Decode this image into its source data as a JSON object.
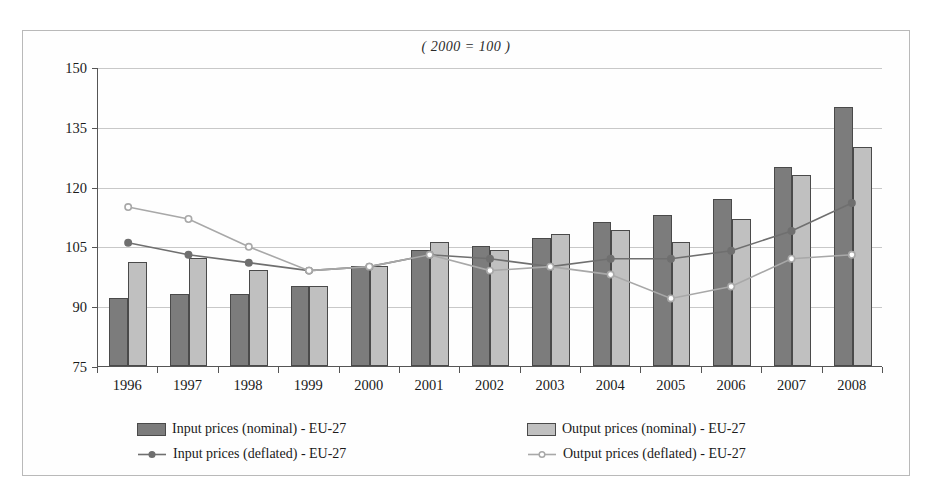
{
  "chart_data": {
    "type": "bar",
    "title": "( 2000 = 100 )",
    "subtitle": "",
    "xlabel": "",
    "ylabel": "",
    "ylim": [
      75,
      150
    ],
    "yticks": [
      75,
      90,
      105,
      120,
      135,
      150
    ],
    "grid": true,
    "legend_position": "bottom",
    "categories": [
      "1996",
      "1997",
      "1998",
      "1999",
      "2000",
      "2001",
      "2002",
      "2003",
      "2004",
      "2005",
      "2006",
      "2007",
      "2008"
    ],
    "series": [
      {
        "name": "Input prices (nominal) - EU-27",
        "kind": "bar",
        "color": "#7c7c7c",
        "values": [
          92,
          93,
          93,
          95,
          100,
          104,
          105,
          107,
          111,
          113,
          117,
          125,
          140
        ]
      },
      {
        "name": "Output prices (nominal) - EU-27",
        "kind": "bar",
        "color": "#c0c0c0",
        "values": [
          101,
          102,
          99,
          95,
          100,
          106,
          104,
          108,
          109,
          106,
          112,
          123,
          130
        ]
      },
      {
        "name": "Input prices (deflated) - EU-27",
        "kind": "line",
        "color": "#6f6f6f",
        "marker": "filled-circle",
        "values": [
          106,
          103,
          101,
          99,
          100,
          103,
          102,
          100,
          102,
          102,
          104,
          109,
          116
        ]
      },
      {
        "name": "Output prices (deflated) - EU-27",
        "kind": "line",
        "color": "#a8a8a8",
        "marker": "open-circle",
        "values": [
          115,
          112,
          105,
          99,
          100,
          103,
          99,
          100,
          98,
          92,
          95,
          102,
          103
        ]
      }
    ]
  },
  "legend": {
    "entries": [
      {
        "label": "Input prices (nominal) - EU-27",
        "type": "swatch-dark"
      },
      {
        "label": "Output prices (nominal) - EU-27",
        "type": "swatch-light"
      },
      {
        "label": "Input prices (deflated) - EU-27",
        "type": "line-dark"
      },
      {
        "label": "Output prices (deflated) - EU-27",
        "type": "line-light"
      }
    ]
  },
  "colors": {
    "bar_input_nominal": "#7c7c7c",
    "bar_output_nominal": "#c0c0c0",
    "line_input_deflated": "#6f6f6f",
    "line_output_deflated": "#a8a8a8",
    "grid": "#c8c8c8",
    "axis": "#555555",
    "frame": "#b9b9b9"
  }
}
